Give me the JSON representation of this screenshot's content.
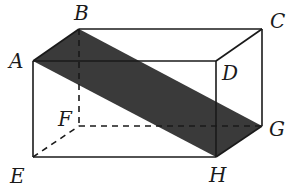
{
  "diagram": {
    "type": "rectangular prism with shaded diagonal plane ABHG",
    "colors": {
      "edge": "#1a1a1a",
      "shade": "#3a3a3a",
      "background": "#ffffff"
    },
    "vertices": {
      "A": {
        "label": "A",
        "x": 33,
        "y": 61
      },
      "B": {
        "label": "B",
        "x": 79,
        "y": 29
      },
      "C": {
        "label": "C",
        "x": 262,
        "y": 29
      },
      "D": {
        "label": "D",
        "x": 216,
        "y": 61
      },
      "E": {
        "label": "E",
        "x": 33,
        "y": 157
      },
      "F": {
        "label": "F",
        "x": 79,
        "y": 126
      },
      "G": {
        "label": "G",
        "x": 262,
        "y": 126
      },
      "H": {
        "label": "H",
        "x": 216,
        "y": 157
      }
    },
    "shaded_plane": [
      "A",
      "B",
      "G",
      "H"
    ],
    "hidden_edges": [
      "BF",
      "EF",
      "FG"
    ]
  }
}
